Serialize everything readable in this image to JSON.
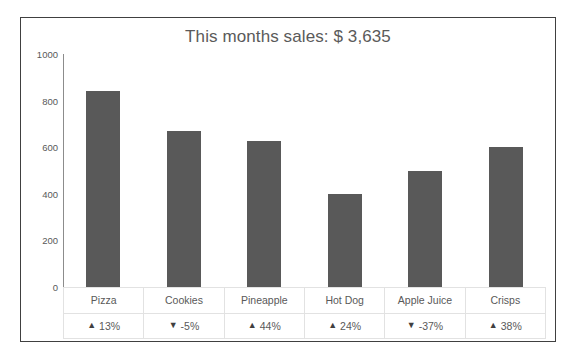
{
  "chart_data": {
    "type": "bar",
    "title": "This months sales: $ 3,635",
    "xlabel": "",
    "ylabel": "",
    "ylim": [
      0,
      1000
    ],
    "yticks": [
      1000,
      800,
      600,
      400,
      200,
      0
    ],
    "grid": false,
    "legend": false,
    "bar_color": "#595959",
    "categories": [
      "Pizza",
      "Cookies",
      "Pineapple",
      "Hot Dog",
      "Apple Juice",
      "Crisps"
    ],
    "values": [
      840,
      670,
      625,
      400,
      500,
      600
    ],
    "data_table": {
      "rows": [
        {
          "name": "Pizza",
          "value": 840,
          "arrow": "▲",
          "delta": "13%",
          "direction": "up"
        },
        {
          "name": "Cookies",
          "value": 670,
          "arrow": "▼",
          "delta": "-5%",
          "direction": "down"
        },
        {
          "name": "Pineapple",
          "value": 625,
          "arrow": "▲",
          "delta": "44%",
          "direction": "up"
        },
        {
          "name": "Hot Dog",
          "value": 400,
          "arrow": "▲",
          "delta": "24%",
          "direction": "up"
        },
        {
          "name": "Apple Juice",
          "value": 500,
          "arrow": "▼",
          "delta": "-37%",
          "direction": "down"
        },
        {
          "name": "Crisps",
          "value": 600,
          "arrow": "▲",
          "delta": "38%",
          "direction": "up"
        }
      ]
    },
    "total_label": "$ 3,635",
    "total_value": 3635
  },
  "colors": {
    "bar": "#595959",
    "title_text": "#5a5a5a",
    "axis": "#8c8c8c",
    "frame_border": "#404040",
    "table_border": "#e2e2e2"
  }
}
